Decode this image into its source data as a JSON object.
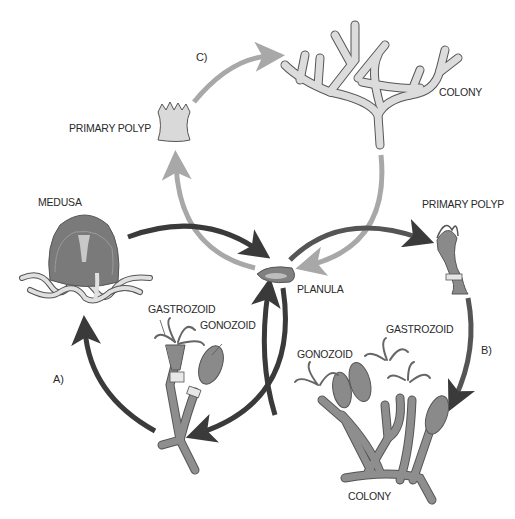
{
  "colors": {
    "arrow_dark": "#3a3a3a",
    "arrow_light": "#a8a8a8",
    "body_dark": "#7a7a7a",
    "body_light": "#d6d6d6",
    "outline": "#555555",
    "text": "#2a2a2a"
  },
  "labels": {
    "cycle_c": "C)",
    "cycle_a": "A)",
    "cycle_b": "B)",
    "primary_polyp_top": "PRIMARY POLYP",
    "colony_top": "COLONY",
    "medusa": "MEDUSA",
    "planula": "PLANULA",
    "primary_polyp_right": "PRIMARY POLYP",
    "gastrozoid_left": "GASTROZOID",
    "gonozoid_left": "GONOZOID",
    "gastrozoid_right": "GASTROZOID",
    "gonozoid_right": "GONOZOID",
    "colony_bottom": "COLONY"
  }
}
